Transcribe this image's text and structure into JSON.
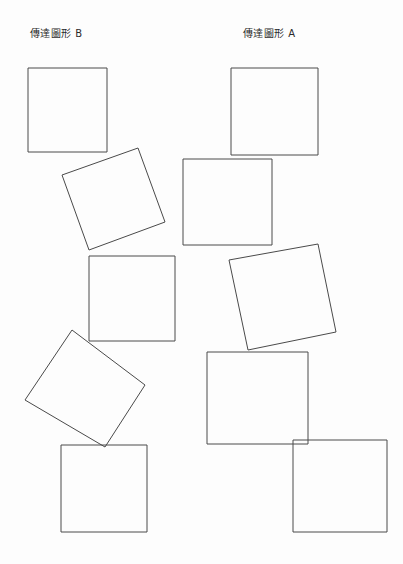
{
  "page": {
    "background_color": "#fdfdfd",
    "ink_color": "#4a4a4a",
    "width": 403,
    "height": 564,
    "document_type": "scanned worksheet"
  },
  "labels": {
    "figure_b": "傳達圖形 B",
    "figure_a": "傳達圖形 A"
  },
  "chart_data": {
    "type": "diagram",
    "groups": [
      {
        "name": "傳達圖形 B",
        "label_position": {
          "x": 30,
          "y": 28
        },
        "shapes": [
          {
            "id": "b1",
            "kind": "square",
            "rotation_deg": 0,
            "points": [
              [
                28,
                68
              ],
              [
                107,
                68
              ],
              [
                107,
                152
              ],
              [
                28,
                152
              ]
            ]
          },
          {
            "id": "b2",
            "kind": "square",
            "rotation_deg": -21,
            "points": [
              [
                62,
                175
              ],
              [
                138,
                148
              ],
              [
                165,
                222
              ],
              [
                89,
                250
              ]
            ]
          },
          {
            "id": "b3",
            "kind": "square",
            "rotation_deg": 0,
            "points": [
              [
                89,
                256
              ],
              [
                175,
                256
              ],
              [
                175,
                341
              ],
              [
                89,
                341
              ]
            ]
          },
          {
            "id": "b4",
            "kind": "square",
            "rotation_deg": -37,
            "points": [
              [
                72,
                330
              ],
              [
                145,
                385
              ],
              [
                105,
                447
              ],
              [
                25,
                400
              ]
            ]
          },
          {
            "id": "b5",
            "kind": "square",
            "rotation_deg": 0,
            "points": [
              [
                61,
                445
              ],
              [
                147,
                445
              ],
              [
                147,
                532
              ],
              [
                61,
                532
              ]
            ]
          }
        ]
      },
      {
        "name": "傳達圖形 A",
        "label_position": {
          "x": 243,
          "y": 28
        },
        "shapes": [
          {
            "id": "a1",
            "kind": "square",
            "rotation_deg": 0,
            "points": [
              [
                231,
                68
              ],
              [
                318,
                68
              ],
              [
                318,
                155
              ],
              [
                231,
                155
              ]
            ]
          },
          {
            "id": "a2",
            "kind": "square",
            "rotation_deg": 0,
            "points": [
              [
                183,
                159
              ],
              [
                272,
                159
              ],
              [
                272,
                245
              ],
              [
                183,
                245
              ]
            ]
          },
          {
            "id": "a3",
            "kind": "square",
            "rotation_deg": -11,
            "points": [
              [
                229,
                260
              ],
              [
                318,
                244
              ],
              [
                336,
                332
              ],
              [
                248,
                350
              ]
            ]
          },
          {
            "id": "a4",
            "kind": "square",
            "rotation_deg": 0,
            "points": [
              [
                207,
                352
              ],
              [
                308,
                352
              ],
              [
                308,
                444
              ],
              [
                207,
                444
              ]
            ]
          },
          {
            "id": "a5",
            "kind": "square",
            "rotation_deg": 0,
            "points": [
              [
                293,
                440
              ],
              [
                387,
                440
              ],
              [
                387,
                532
              ],
              [
                293,
                532
              ]
            ]
          }
        ]
      }
    ],
    "shape_count": 10,
    "legend": [],
    "grid": false,
    "axes": false
  }
}
